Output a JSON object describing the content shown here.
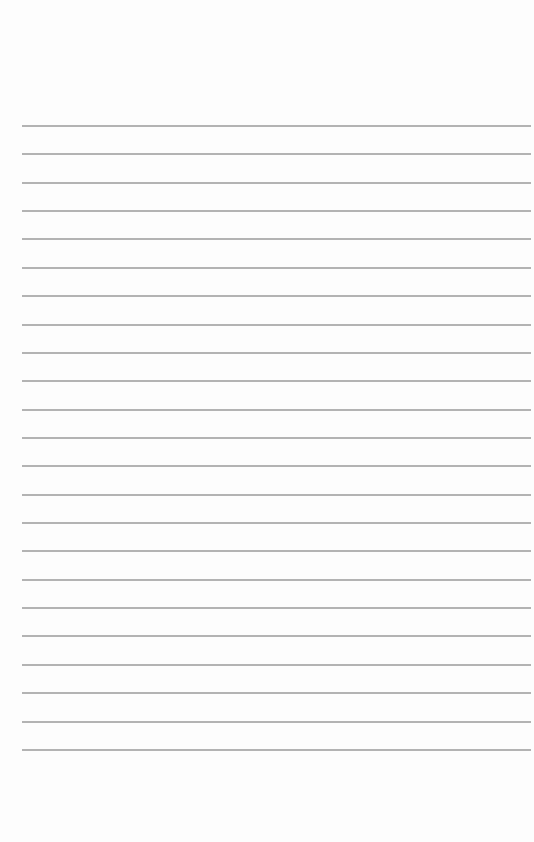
{
  "page": {
    "type": "lined-paper",
    "line_count": 23,
    "first_line_y": 125,
    "line_spacing": 28.36,
    "line_left": 22,
    "line_right": 531,
    "line_color": "#b3b3b3",
    "background_color": "#fdfdfd"
  }
}
